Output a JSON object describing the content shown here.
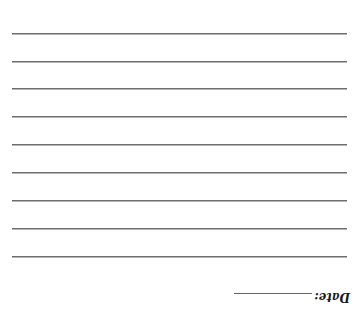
{
  "document": {
    "ruled_lines": [
      {
        "y": 33
      },
      {
        "y": 61
      },
      {
        "y": 88
      },
      {
        "y": 116
      },
      {
        "y": 144
      },
      {
        "y": 172
      },
      {
        "y": 200
      },
      {
        "y": 228
      },
      {
        "y": 256
      }
    ],
    "date_label": "Date:",
    "orientation": "upside-down"
  }
}
